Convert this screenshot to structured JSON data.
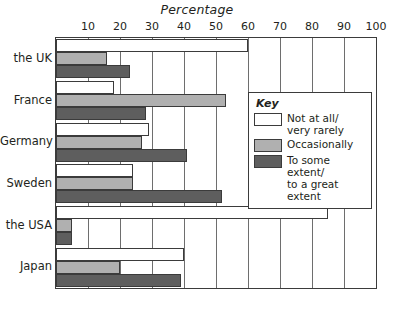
{
  "chart_data": {
    "type": "bar",
    "orientation": "horizontal",
    "title": "Percentage",
    "xlabel": "Percentage",
    "ylabel": "",
    "xlim": [
      0,
      100
    ],
    "grid": true,
    "legend_position": "inside-right",
    "legend_title": "Key",
    "categories": [
      "the UK",
      "France",
      "Germany",
      "Sweden",
      "the USA",
      "Japan"
    ],
    "ticks": [
      0,
      10,
      20,
      30,
      40,
      50,
      60,
      70,
      80,
      90,
      100
    ],
    "tick_labels": [
      "",
      "10",
      "20",
      "30",
      "40",
      "50",
      "60",
      "70",
      "80",
      "90",
      "100"
    ],
    "series": [
      {
        "name": "Not at all/\nvery rarely",
        "color": "#ffffff",
        "values": [
          60,
          18,
          29,
          24,
          85,
          40
        ]
      },
      {
        "name": "Occasionally",
        "color": "#b0b0b0",
        "values": [
          16,
          53,
          27,
          24,
          5,
          20
        ]
      },
      {
        "name": "To some extent/\nto a great extent",
        "color": "#5e5e5e",
        "values": [
          23,
          28,
          41,
          52,
          5,
          39
        ]
      }
    ]
  },
  "colors": {
    "axis": "#3b3b3b",
    "grid": "#6e6e6e",
    "series_0": "#ffffff",
    "series_1": "#b0b0b0",
    "series_2": "#5e5e5e",
    "text": "#231f20",
    "background": "#ffffff"
  }
}
